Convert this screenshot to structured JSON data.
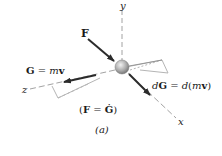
{
  "figure": {
    "axes": {
      "x": "x",
      "y": "y",
      "z": "z"
    },
    "force_label": "F",
    "momentum_label": {
      "lhs": "G",
      "eq": " = ",
      "m": "m",
      "v": "v"
    },
    "momentum_change_label": {
      "d1": "d",
      "G": "G",
      "eq": " = ",
      "d2": "d",
      "open": "(",
      "m": "m",
      "v": "v",
      "close": ")"
    },
    "equation": {
      "open": "(",
      "F": "F",
      "eq": " = ",
      "Gdot": "Ġ",
      "close": ")"
    },
    "caption": "(a)",
    "colors": {
      "arrow": "#2b2b2b",
      "axis": "#8a8a8a",
      "plane": "#b5b5b5",
      "sphere": "#a9a9a9"
    }
  }
}
